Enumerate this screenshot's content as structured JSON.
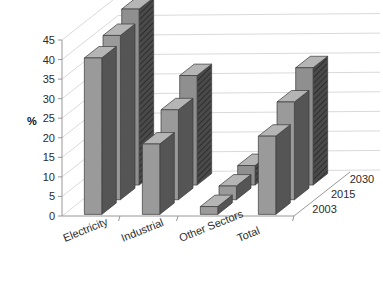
{
  "chart_data": {
    "type": "bar",
    "title": "",
    "subtitle": "",
    "xlabel": "",
    "ylabel": "%",
    "zlabel": "",
    "categories": [
      "Electricity",
      "Industrial",
      "Other Sectors",
      "Total"
    ],
    "series": [
      {
        "name": "2003",
        "values": [
          40,
          18,
          2,
          20
        ]
      },
      {
        "name": "2015",
        "values": [
          42,
          23,
          3.5,
          25
        ]
      },
      {
        "name": "2030",
        "values": [
          45,
          28,
          5,
          30
        ]
      }
    ],
    "ylim": [
      0,
      45
    ],
    "yticks": [
      0,
      5,
      10,
      15,
      20,
      25,
      30,
      35,
      40,
      45
    ],
    "ytick_labels": [
      "0",
      "5",
      "10",
      "15",
      "20",
      "25",
      "30",
      "35",
      "40",
      "45"
    ],
    "grid": true,
    "legend": "none",
    "projection": "3d",
    "depth_axis_labels": [
      "2003",
      "2015",
      "2030"
    ]
  },
  "style": {
    "background": "#ffffff",
    "bar_front": "#9a9a9a",
    "bar_front_back_series": "#8f8f8f",
    "bar_side": "#555555",
    "bar_side_hatch": "#3d3d3d",
    "bar_top": "#b5b5b5",
    "gridline": "#cfcfcf",
    "axis": "#8d8d8d",
    "text": "#2b2b2b"
  }
}
